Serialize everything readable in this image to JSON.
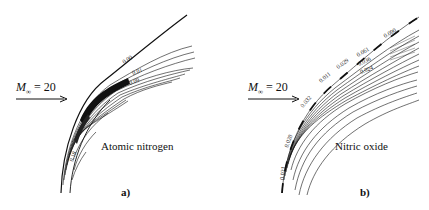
{
  "figure": {
    "panels": [
      {
        "id": "a",
        "panel_label": "a)",
        "species": "Atomic nitrogen",
        "freestream": {
          "symbol": "M",
          "subscript": "∞",
          "equals": "= 20"
        },
        "contour_labels": [
          "0.00",
          "0.01",
          "0.09",
          "0.18"
        ]
      },
      {
        "id": "b",
        "panel_label": "b)",
        "species": "Nitric oxide",
        "freestream": {
          "symbol": "M",
          "subscript": "∞",
          "equals": "= 20"
        },
        "contour_labels": [
          "0.090",
          "0.061",
          "0.036",
          "0.029",
          "0.024",
          "0.011",
          "0.032",
          "0.020",
          "0.021"
        ]
      }
    ]
  }
}
